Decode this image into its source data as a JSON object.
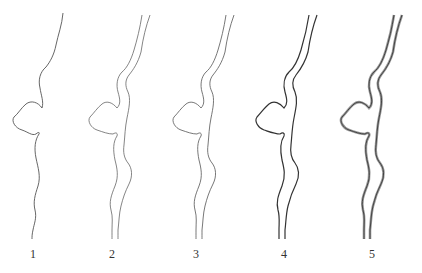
{
  "figure": {
    "stroke_color": "#4a4a4a",
    "panels": [
      {
        "label": "1",
        "style": "single-line",
        "offset_x": 0
      },
      {
        "label": "2",
        "style": "double-line-thin",
        "offset_x": 85
      },
      {
        "label": "3",
        "style": "double-line-thin",
        "offset_x": 169
      },
      {
        "label": "4",
        "style": "double-line-bold",
        "offset_x": 252
      },
      {
        "label": "5",
        "style": "double-line-shaded",
        "offset_x": 337
      }
    ]
  }
}
